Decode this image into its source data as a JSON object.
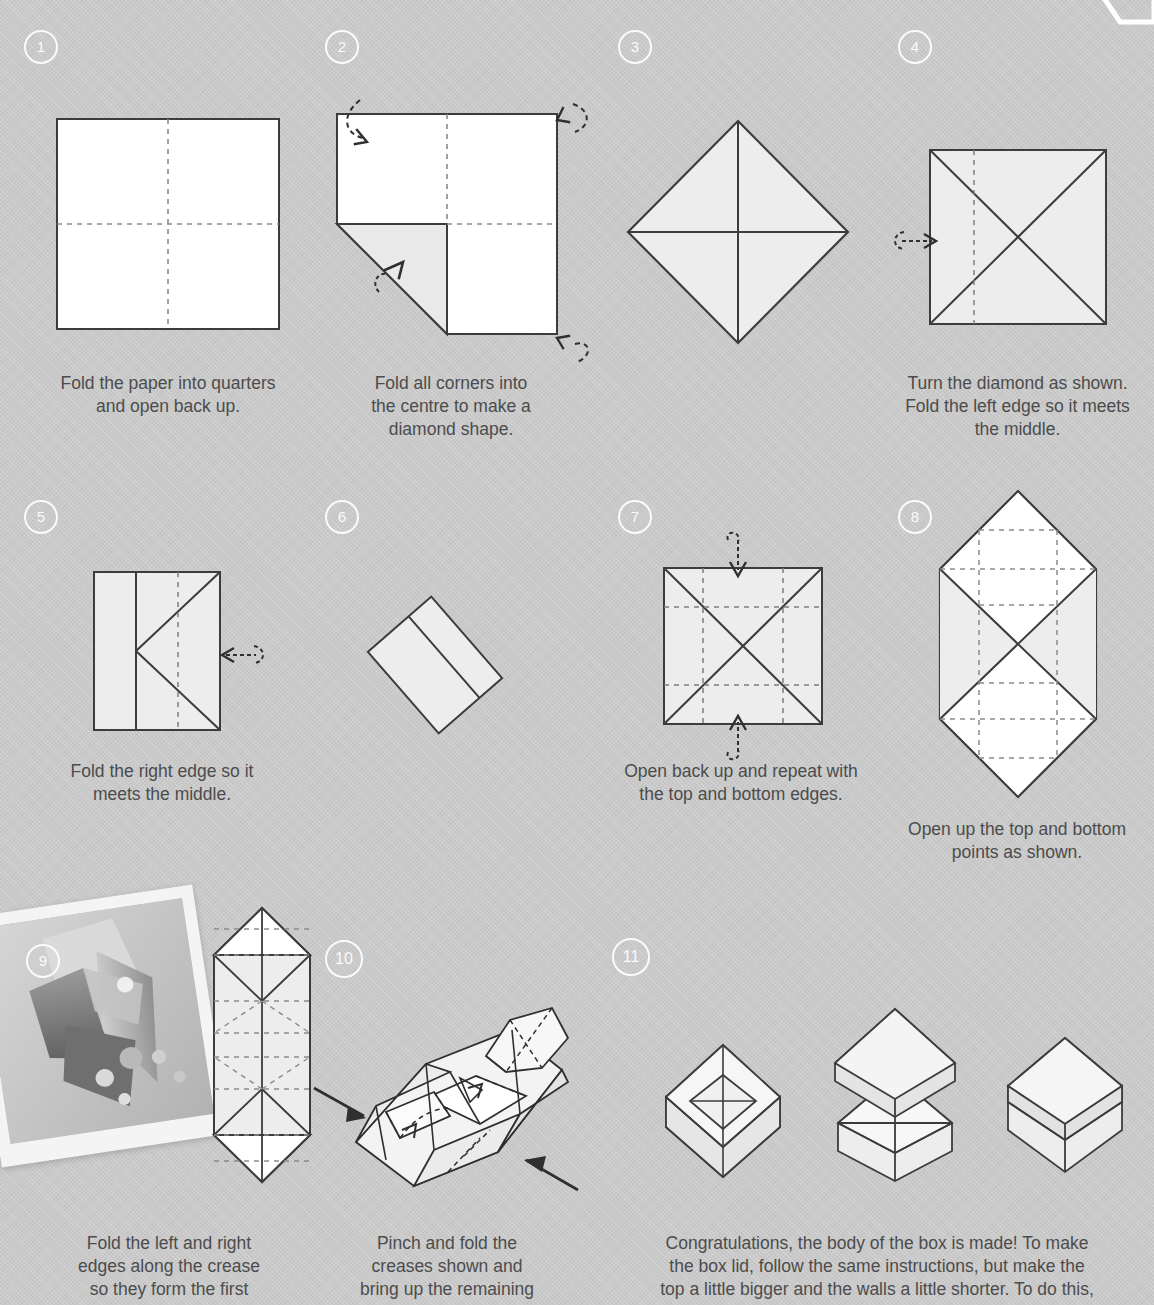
{
  "document": {
    "title": "How to fold an origami box",
    "background_color": "#c9c9c9",
    "ink_color": "#3c3c3c",
    "text_color": "#4c4c4c",
    "paper_fill_white": "#ffffff",
    "paper_fill_shaded": "#ededed",
    "badge_color": "#ffffff"
  },
  "steps": [
    {
      "number": "1",
      "caption": "Fold the paper into quarters\nand open back up.",
      "figure": "square-quartered",
      "notes": "Plain white square with dashed horizontal and vertical centre creases."
    },
    {
      "number": "2",
      "caption": "Fold all corners into\nthe centre to make a\ndiamond shape.",
      "figure": "square-corner-folded",
      "notes": "Square with bottom-left corner folded to centre; curved arrows at three other corners."
    },
    {
      "number": "3",
      "caption": "",
      "figure": "diamond",
      "notes": "Diamond (rotated square) with vertical and horizontal centre lines."
    },
    {
      "number": "4",
      "caption": "Turn the diamond as shown.\nFold the left edge so it meets\nthe middle.",
      "figure": "square-with-x-and-left-crease",
      "notes": "Square with X diagonals, dashed vertical quarter line at left, arrow pointing right."
    },
    {
      "number": "5",
      "caption": "Fold the right edge so it\nmeets the middle.",
      "figure": "rectangle-k-fold",
      "notes": "Tall rectangle, vertical solid line at one third, K-shaped diagonals, dashed vertical line, left-pointing arrow."
    },
    {
      "number": "6",
      "caption": "",
      "figure": "tilted-rectangle",
      "notes": "Narrow rectangle rotated about 50 degrees with a single lengthwise fold line."
    },
    {
      "number": "7",
      "caption": "Open back up and repeat with\nthe top and bottom edges.",
      "figure": "square-grid-x",
      "notes": "Square with X diagonals and dashed quarter grid lines; down arrow at top, up arrow at bottom."
    },
    {
      "number": "8",
      "caption": "Open up the top and bottom\npoints as shown.",
      "figure": "hexagon-points",
      "notes": "Tall hexagon with pointed top and bottom, X crease in the middle and dashed grid."
    },
    {
      "number": "9",
      "caption": "Fold the left and right\nedges along the crease\nso they form the first",
      "figure": "tall-pointed-strip",
      "notes": "Tall narrow strip with pointed ends and many dashed creases. Accompanied by a tilted photograph of polka-dot folded paper."
    },
    {
      "number": "10",
      "caption": "Pinch and fold the\ncreases shown and\nbring up the remaining",
      "figure": "three-d-partial-box",
      "notes": "Angled three-dimensional partially folded box with two solid black arrows pointing inward."
    },
    {
      "number": "11",
      "caption": "Congratulations, the body of the box is made! To make\nthe box lid, follow the same instructions, but make the\ntop a little bigger and the walls a little shorter. To do this,",
      "figure": "three-boxes",
      "notes": "Three isometric boxes: open box, box with lid floating above, closed box with lid on."
    }
  ],
  "photo": {
    "alt": "Folded polka dot paper photographed from above",
    "frame": "white polaroid border",
    "rotation": "-8.5deg"
  }
}
